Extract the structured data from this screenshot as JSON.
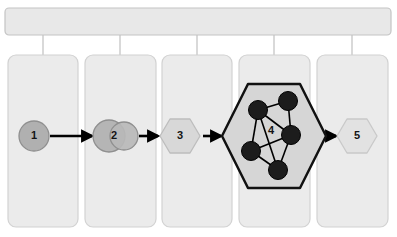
{
  "diagram": {
    "title_bar": {
      "name": "top-container-bar",
      "label": "",
      "fill": "#e8e8e8",
      "stroke": "#c4c4c4",
      "x": 5,
      "y": 8,
      "width": 386,
      "height": 27,
      "radius": 4
    },
    "connector_color": "#c0c0c0",
    "columns": [
      {
        "id": "column-1",
        "label": "",
        "x": 8,
        "y": 55,
        "width": 70,
        "height": 172,
        "fill": "#ebebeb",
        "stroke": "#d2d2d2",
        "connector_x": 43
      },
      {
        "id": "column-2",
        "label": "",
        "x": 85,
        "y": 55,
        "width": 71,
        "height": 172,
        "fill": "#ebebeb",
        "stroke": "#d2d2d2",
        "connector_x": 120
      },
      {
        "id": "column-3",
        "label": "",
        "x": 162,
        "y": 55,
        "width": 70,
        "height": 172,
        "fill": "#ebebeb",
        "stroke": "#d2d2d2",
        "connector_x": 197
      },
      {
        "id": "column-4",
        "label": "",
        "x": 239,
        "y": 55,
        "width": 71,
        "height": 172,
        "fill": "#ebebeb",
        "stroke": "#d2d2d2",
        "connector_x": 274
      },
      {
        "id": "column-5",
        "label": "",
        "x": 317,
        "y": 55,
        "width": 71,
        "height": 172,
        "fill": "#ebebeb",
        "stroke": "#d2d2d2",
        "connector_x": 352
      }
    ],
    "stages": [
      {
        "id": "stage-1",
        "label": "1",
        "shape": "circle",
        "cx": 34,
        "cy": 136,
        "r": 15,
        "fill": "#b0b0b0",
        "stroke": "#8f8f8f"
      },
      {
        "id": "stage-2",
        "label": "2",
        "shape": "double-circle",
        "cx": 114,
        "cy": 136,
        "circles": [
          {
            "cx": 109,
            "cy": 136,
            "r": 16,
            "fill": "#b0b0b0",
            "stroke": "#8f8f8f"
          },
          {
            "cx": 124,
            "cy": 136,
            "r": 14,
            "fill": "#b8b8b8",
            "stroke": "#8f8f8f"
          }
        ]
      },
      {
        "id": "stage-3",
        "label": "3",
        "shape": "hexagon",
        "cx": 180,
        "cy": 136,
        "rx": 20,
        "ry": 17,
        "fill": "#d8d8d8",
        "stroke": "#bdbdbd"
      },
      {
        "id": "stage-4",
        "label": "4",
        "shape": "hexagon-network",
        "cx": 274,
        "cy": 136,
        "rx": 52,
        "ry": 52,
        "fill": "#d6d6d6",
        "stroke": "#111111",
        "stroke_width": 2.5
      },
      {
        "id": "stage-5",
        "label": "5",
        "shape": "hexagon",
        "cx": 357,
        "cy": 136,
        "rx": 20,
        "ry": 17,
        "fill": "#e2e2e2",
        "stroke": "#c9c9c9"
      }
    ],
    "arrows": [
      {
        "id": "arrow-1-to-2",
        "x1": 50,
        "y1": 136,
        "x2": 92,
        "y2": 136
      },
      {
        "id": "arrow-2-to-3",
        "x1": 139,
        "y1": 136,
        "x2": 158,
        "y2": 136
      },
      {
        "id": "arrow-3-to-4",
        "x1": 203,
        "y1": 136,
        "x2": 221,
        "y2": 136
      },
      {
        "id": "arrow-4-to-5",
        "x1": 327,
        "y1": 136,
        "x2": 336,
        "y2": 136
      },
      {
        "id": "arrow-color",
        "color": "#000000",
        "width": 2.6
      }
    ],
    "network": {
      "node_fill": "#1c1c1c",
      "node_stroke": "#000000",
      "edge_color": "#000000",
      "edge_width": 1.6,
      "node_radius": 9.5,
      "nodes": [
        {
          "id": "node-upper-left",
          "cx": 258,
          "cy": 110
        },
        {
          "id": "node-upper-right",
          "cx": 288,
          "cy": 101
        },
        {
          "id": "node-middle-right",
          "cx": 291,
          "cy": 135
        },
        {
          "id": "node-lower-left",
          "cx": 251,
          "cy": 151
        },
        {
          "id": "node-bottom-center",
          "cx": 278,
          "cy": 170
        }
      ],
      "edges": [
        {
          "from": "node-upper-left",
          "to": "node-upper-right"
        },
        {
          "from": "node-upper-left",
          "to": "node-middle-right"
        },
        {
          "from": "node-upper-left",
          "to": "node-lower-left"
        },
        {
          "from": "node-upper-left",
          "to": "node-bottom-center"
        },
        {
          "from": "node-upper-right",
          "to": "node-middle-right"
        },
        {
          "from": "node-middle-right",
          "to": "node-lower-left"
        },
        {
          "from": "node-middle-right",
          "to": "node-bottom-center"
        },
        {
          "from": "node-lower-left",
          "to": "node-bottom-center"
        }
      ],
      "center_label": "4",
      "center_label_x": 271,
      "center_label_y": 131
    }
  }
}
